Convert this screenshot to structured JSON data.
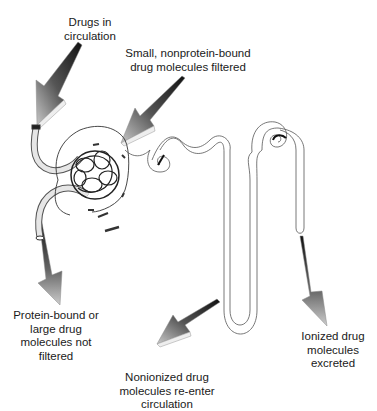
{
  "diagram": {
    "labels": {
      "drugs_in_circulation": "Drugs in\ncirculation",
      "filtered": "Small, nonprotein-bound\ndrug molecules filtered",
      "not_filtered": "Protein-bound or\nlarge drug\nmolecules not\nfiltered",
      "reabsorbed": "Nonionized drug\nmolecules re-enter\ncirculation",
      "excreted": "Ionized drug\nmolecules\nexcreted"
    },
    "structures": [
      "afferent-arteriole",
      "glomerulus",
      "bowmans-capsule",
      "efferent-arteriole",
      "proximal-tubule",
      "loop-of-henle",
      "distal-tubule",
      "collecting-duct"
    ],
    "colors": {
      "arrow_dark": "#1a1a1a",
      "arrow_light": "#bdbdbd",
      "line": "#555555",
      "text": "#1a1a1a"
    }
  }
}
